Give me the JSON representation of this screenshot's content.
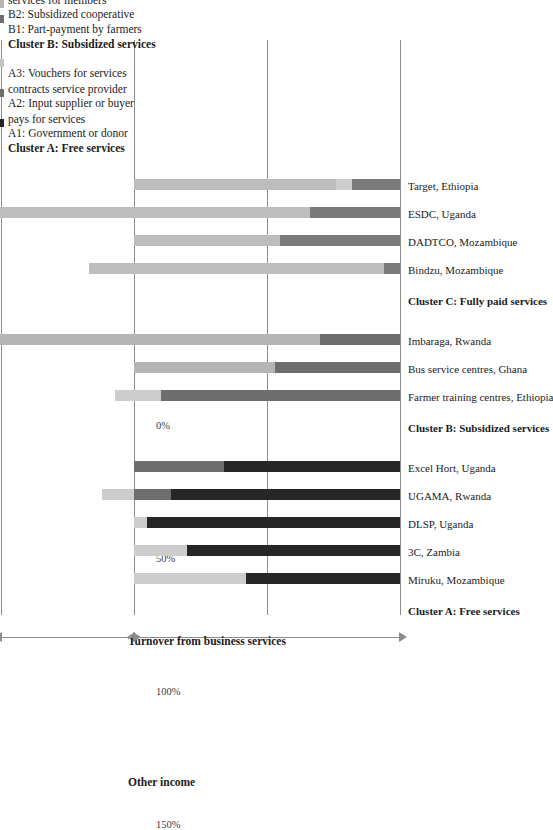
{
  "chart_data": {
    "type": "bar",
    "orientation": "vertical-stacked",
    "title": "",
    "xlabel": "",
    "ylabel": "",
    "ylim": [
      0,
      160
    ],
    "grid": true,
    "yticks": [
      "0%",
      "50%",
      "100%",
      "150%"
    ],
    "ytick_values": [
      0,
      50,
      100,
      150
    ],
    "axis_spans": [
      {
        "label": "Turnover from business services",
        "from": 0,
        "to": 100
      },
      {
        "label": "Other income",
        "from": 100,
        "to": 150
      }
    ],
    "series": [
      {
        "name": "A1: Government or donor pays for services",
        "key": "A1",
        "color": "#262626"
      },
      {
        "name": "A2: Input supplier or buyer contracts service provider",
        "key": "A2",
        "color": "#6e6e6e"
      },
      {
        "name": "A3: Vouchers for services",
        "key": "A3",
        "color": "#c4c4c4"
      },
      {
        "name": "B1: Part-payment by farmers",
        "key": "B1",
        "color": "#6e6e6e"
      },
      {
        "name": "B2: Subsidized cooperative services for members",
        "key": "B2",
        "color": "#b5b5b5"
      },
      {
        "name": "C1: Services paid by the client",
        "key": "C1",
        "color": "#7a7a7a"
      },
      {
        "name": "C2: Embedded services",
        "key": "C2",
        "color": "#bdbdbd"
      },
      {
        "name": "Other income sources",
        "key": "OI",
        "color": "#cdcdcd"
      }
    ],
    "clusters": [
      {
        "header": "Cluster A: Free services",
        "categories": [
          {
            "label": "Miruku, Mozambique",
            "segments": [
              {
                "key": "A1",
                "value": 58
              },
              {
                "key": "OI",
                "value": 42
              }
            ]
          },
          {
            "label": "3C, Zambia",
            "segments": [
              {
                "key": "A1",
                "value": 80
              },
              {
                "key": "OI",
                "value": 20
              }
            ]
          },
          {
            "label": "DLSP, Uganda",
            "segments": [
              {
                "key": "A1",
                "value": 95
              },
              {
                "key": "OI",
                "value": 5
              }
            ]
          },
          {
            "label": "UGAMA, Rwanda",
            "segments": [
              {
                "key": "A1",
                "value": 86
              },
              {
                "key": "A2",
                "value": 14
              },
              {
                "key": "OI",
                "value": 12
              }
            ]
          },
          {
            "label": "Excel Hort, Uganda",
            "segments": [
              {
                "key": "A1",
                "value": 66
              },
              {
                "key": "A2",
                "value": 34
              }
            ]
          }
        ]
      },
      {
        "header": "Cluster B: Subsidized services",
        "categories": [
          {
            "label": "Farmer training centres, Ethiopia",
            "segments": [
              {
                "key": "B1",
                "value": 90
              },
              {
                "key": "OI",
                "value": 17
              }
            ]
          },
          {
            "label": "Bus service centres, Ghana",
            "segments": [
              {
                "key": "B1",
                "value": 47
              },
              {
                "key": "B2",
                "value": 53
              }
            ]
          },
          {
            "label": "Imbaraga, Rwanda",
            "segments": [
              {
                "key": "B1",
                "value": 30
              },
              {
                "key": "B2",
                "value": 127
              }
            ]
          }
        ]
      },
      {
        "header": "Cluster C: Fully paid services",
        "categories": [
          {
            "label": "Bindzu, Mozambique",
            "segments": [
              {
                "key": "C1",
                "value": 6
              },
              {
                "key": "C2",
                "value": 111
              }
            ]
          },
          {
            "label": "DADTCO, Mozambique",
            "segments": [
              {
                "key": "C1",
                "value": 45
              },
              {
                "key": "C2",
                "value": 55
              }
            ]
          },
          {
            "label": "ESDC, Uganda",
            "segments": [
              {
                "key": "C1",
                "value": 34
              },
              {
                "key": "C2",
                "value": 123
              }
            ]
          },
          {
            "label": "Target, Ethiopia",
            "segments": [
              {
                "key": "C1",
                "value": 18
              },
              {
                "key": "OI",
                "value": 6
              },
              {
                "key": "C2",
                "value": 76
              }
            ]
          }
        ]
      }
    ]
  },
  "legend": {
    "groups": [
      {
        "title": "Cluster A: Free services",
        "items": [
          {
            "text": "A1: Government or donor\npays for services",
            "color": "#262626"
          },
          {
            "text": "A2: Input supplier or buyer\ncontracts service provider",
            "color": "#6e6e6e"
          },
          {
            "text": "A3: Vouchers for services",
            "color": "#c4c4c4"
          }
        ]
      },
      {
        "title": "Cluster B: Subsidized services",
        "items": [
          {
            "text": "B1: Part-payment by farmers",
            "color": "#6e6e6e"
          },
          {
            "text": "B2: Subsidized cooperative\nservices for members",
            "color": "#b5b5b5"
          }
        ]
      },
      {
        "title": "Cluster C: Fully paid services",
        "items": [
          {
            "text": "C1: Services paid by the client",
            "color": "#7a7a7a"
          },
          {
            "text": "C2: Embedded services",
            "color": "#bdbdbd"
          }
        ]
      },
      {
        "title": "Other income sources",
        "items": [
          {
            "text": "",
            "color": "#cdcdcd"
          }
        ]
      }
    ]
  },
  "colors": {
    "grid": "#8c8c8c",
    "arrow": "#8c8c8c",
    "text": "#1b1b1b"
  }
}
